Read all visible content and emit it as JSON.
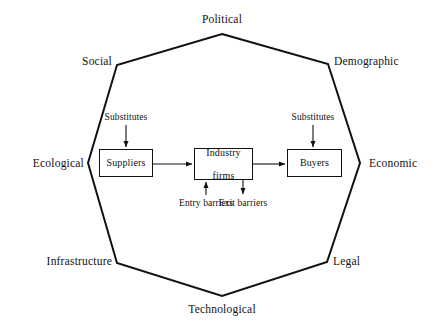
{
  "diagram": {
    "environment_ring": {
      "shape": "heptagon",
      "labels": [
        {
          "id": "political",
          "text": "Political",
          "x": 222,
          "y": 13,
          "align": "center"
        },
        {
          "id": "demographic",
          "text": "Demographic",
          "x": 334,
          "y": 55,
          "align": "left"
        },
        {
          "id": "economic",
          "text": "Economic",
          "x": 369,
          "y": 157,
          "align": "left"
        },
        {
          "id": "legal",
          "text": "Legal",
          "x": 333,
          "y": 255,
          "align": "left"
        },
        {
          "id": "technological",
          "text": "Technological",
          "x": 222,
          "y": 303,
          "align": "center"
        },
        {
          "id": "infrastructure",
          "text": "Infrastructure",
          "x": 112,
          "y": 255,
          "align": "right"
        },
        {
          "id": "ecological",
          "text": "Ecological",
          "x": 84,
          "y": 157,
          "align": "right"
        },
        {
          "id": "social",
          "text": "Social",
          "x": 112,
          "y": 55,
          "align": "right"
        }
      ]
    },
    "nodes": [
      {
        "id": "suppliers",
        "label": "Suppliers",
        "x": 99,
        "y": 149,
        "w": 54,
        "h": 28
      },
      {
        "id": "industry-firms",
        "label": "Industry\nfirms",
        "line1": "Industry",
        "line2": "firms",
        "x": 194,
        "y": 148,
        "w": 59,
        "h": 32
      },
      {
        "id": "buyers",
        "label": "Buyers",
        "x": 287,
        "y": 149,
        "w": 55,
        "h": 28
      }
    ],
    "force_labels": [
      {
        "id": "substitutes-left",
        "text": "Substitutes",
        "x": 126,
        "y": 112
      },
      {
        "id": "substitutes-right",
        "text": "Substitutes",
        "x": 313,
        "y": 112
      },
      {
        "id": "entry-barriers",
        "line1": "Entry",
        "line2": "barriers",
        "x": 206,
        "y": 203
      },
      {
        "id": "exit-barriers",
        "line1": "Exit",
        "line2": "barriers",
        "x": 243,
        "y": 203
      }
    ],
    "connectors": [
      {
        "id": "suppliers-to-industry",
        "from": "suppliers",
        "to": "industry-firms",
        "direction": "right"
      },
      {
        "id": "industry-to-buyers",
        "from": "industry-firms",
        "to": "buyers",
        "direction": "right"
      },
      {
        "id": "substitutes-to-suppliers",
        "from": "substitutes-left",
        "to": "suppliers",
        "direction": "down"
      },
      {
        "id": "substitutes-to-buyers",
        "from": "substitutes-right",
        "to": "buyers",
        "direction": "down"
      },
      {
        "id": "entry-to-industry",
        "from": "entry-barriers",
        "to": "industry-firms",
        "direction": "up"
      },
      {
        "id": "industry-to-exit",
        "from": "industry-firms",
        "to": "exit-barriers",
        "direction": "down"
      }
    ],
    "colors": {
      "stroke": "#111111",
      "text": "#121212",
      "background": "#ffffff"
    }
  }
}
